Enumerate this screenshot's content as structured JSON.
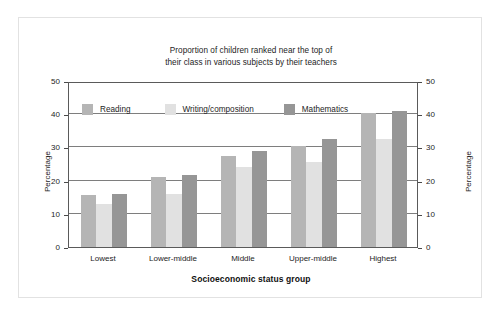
{
  "chart_data": {
    "type": "bar",
    "title": "Proportion of children ranked near the top of their class in various subjects by their teachers",
    "title_lines": [
      "Proportion of children ranked near the top of",
      "their class in various subjects by their teachers"
    ],
    "xlabel": "Socioeconomic status group",
    "ylabel": "Percentage",
    "ylabel_right": "Percentage",
    "categories": [
      "Lowest",
      "Lower-middle",
      "Middle",
      "Upper-middle",
      "Highest"
    ],
    "series": [
      {
        "name": "Reading",
        "color": "#b5b5b5",
        "values": [
          15.8,
          21.0,
          27.5,
          30.5,
          40.5
        ]
      },
      {
        "name": "Writing/composition",
        "color": "#e1e1e1",
        "values": [
          13.0,
          16.0,
          24.0,
          25.5,
          32.5
        ]
      },
      {
        "name": "Mathematics",
        "color": "#969696",
        "values": [
          16.0,
          21.7,
          29.0,
          32.5,
          41.0
        ]
      }
    ],
    "ylim": [
      0,
      50
    ],
    "yticks": [
      0,
      10,
      20,
      30,
      40,
      50
    ],
    "ytick_labels": [
      "0",
      "10",
      "20",
      "30",
      "40",
      "50"
    ],
    "ytick_labels_right": [
      "0",
      "10",
      "20",
      "30",
      "40",
      "50"
    ],
    "grid": true,
    "grid_axis": "y",
    "legend_position": "top-inside-left",
    "axes_color": "#5a5a5a",
    "grid_color": "#7e7e7e",
    "background": "#ffffff",
    "frame_color": "#e2e2e2"
  }
}
